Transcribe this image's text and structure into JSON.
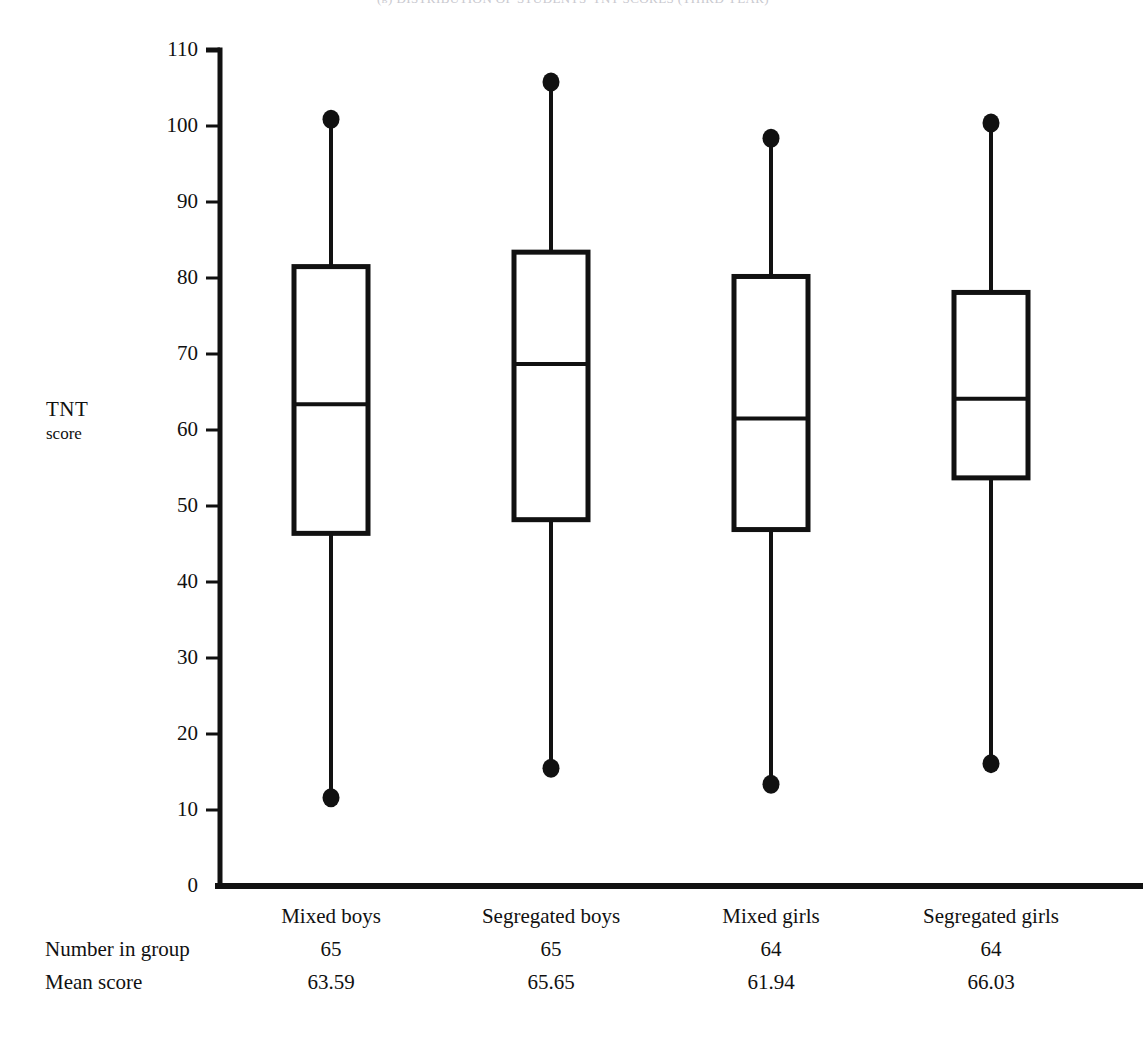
{
  "chart_title": "(b) DISTRIBUTION OF STUDENTS' TNT SCORES (THIRD YEAR)",
  "axis_caption": {
    "line1": "TNT",
    "line2": "score"
  },
  "y_axis": {
    "ticks": [
      0,
      10,
      20,
      30,
      40,
      50,
      60,
      70,
      80,
      90,
      100,
      110
    ],
    "labels": [
      "0",
      "10",
      "20",
      "30",
      "40",
      "50",
      "60",
      "70",
      "80",
      "90",
      "100",
      "110"
    ],
    "min": 0,
    "max": 110
  },
  "table": {
    "row_labels": [
      "Number in group",
      "Mean score"
    ],
    "group_names": [
      "Mixed boys",
      "Segregated boys",
      "Mixed girls",
      "Segregated girls"
    ],
    "number_in_group": [
      "65",
      "65",
      "64",
      "64"
    ],
    "mean_score": [
      "63.59",
      "65.65",
      "61.94",
      "66.03"
    ]
  },
  "chart_data": {
    "type": "box",
    "title": "(b) DISTRIBUTION OF STUDENTS' TNT SCORES (THIRD YEAR)",
    "xlabel": "",
    "ylabel": "TNT score",
    "ylim": [
      0,
      110
    ],
    "ytick_step": 10,
    "grid": false,
    "legend": "none",
    "categories": [
      "Mixed boys",
      "Segregated boys",
      "Mixed girls",
      "Segregated girls"
    ],
    "series": [
      {
        "name": "Mixed boys",
        "n": 65,
        "mean": 63.59,
        "min": 11.6,
        "q1": 46.4,
        "median": 63.4,
        "q3": 81.5,
        "max": 100.9
      },
      {
        "name": "Segregated boys",
        "n": 65,
        "mean": 65.65,
        "min": 15.5,
        "q1": 48.2,
        "median": 68.7,
        "q3": 83.4,
        "max": 105.8
      },
      {
        "name": "Mixed girls",
        "n": 64,
        "mean": 61.94,
        "min": 13.4,
        "q1": 46.9,
        "median": 61.5,
        "q3": 80.2,
        "max": 98.4
      },
      {
        "name": "Segregated girls",
        "n": 64,
        "mean": 66.03,
        "min": 16.1,
        "q1": 53.7,
        "median": 64.1,
        "q3": 78.1,
        "max": 100.4
      }
    ]
  },
  "colors": {
    "ink": "#111111",
    "background": "#ffffff",
    "title_faded": "#c9c9cf"
  }
}
